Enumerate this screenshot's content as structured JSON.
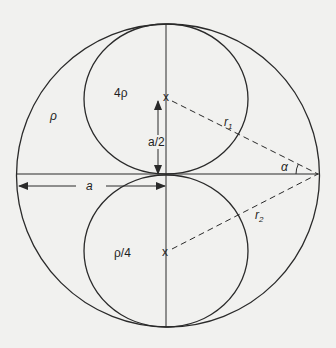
{
  "diagram": {
    "type": "geometry",
    "colors": {
      "background": "#f1f1ef",
      "stroke": "#2a2a2a"
    },
    "labels": {
      "outer_density": "ρ",
      "upper_density": "4ρ",
      "lower_density": "ρ/4",
      "half_a": "a/2",
      "a": "a",
      "r1": "r",
      "r1_sub": "1",
      "r2": "r",
      "r2_sub": "2",
      "alpha": "α",
      "center_mark_upper": "x",
      "center_mark_lower": "x"
    }
  }
}
